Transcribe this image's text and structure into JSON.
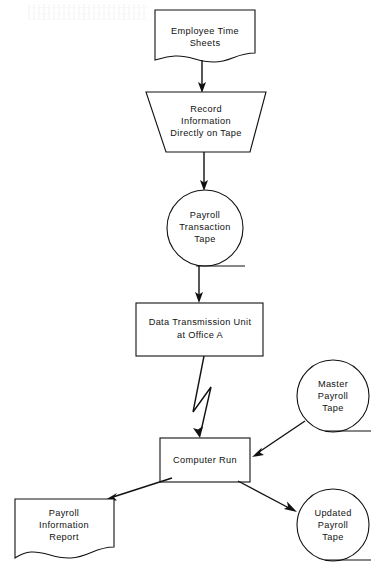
{
  "diagram": {
    "background_color": "#ffffff",
    "line_color": "#111111",
    "nodes": [
      {
        "id": "employee-time-sheets",
        "shape": "document",
        "label_lines": [
          "Employee  Time",
          "Sheets"
        ],
        "x": 205,
        "y": 33
      },
      {
        "id": "record-information",
        "shape": "manual-operation-trapezoid",
        "label_lines": [
          "Record",
          "Information",
          "Directly  on  Tape"
        ],
        "x": 206,
        "y": 122
      },
      {
        "id": "payroll-transaction-tape",
        "shape": "magnetic-tape-circle",
        "label_lines": [
          "Payroll",
          "Transaction",
          "Tape"
        ],
        "x": 205,
        "y": 228
      },
      {
        "id": "data-transmission-unit",
        "shape": "process-rectangle",
        "label_lines": [
          "Data  Transmission  Unit",
          "at  Office  A"
        ],
        "x": 200,
        "y": 329
      },
      {
        "id": "master-payroll-tape",
        "shape": "magnetic-tape-circle",
        "label_lines": [
          "Master",
          "Payroll",
          "Tape"
        ],
        "x": 333,
        "y": 396
      },
      {
        "id": "computer-run",
        "shape": "process-rectangle",
        "label_lines": [
          "Computer  Run"
        ],
        "x": 205,
        "y": 460
      },
      {
        "id": "payroll-information-report",
        "shape": "document",
        "label_lines": [
          "Payroll",
          "Information",
          "Report"
        ],
        "x": 64,
        "y": 524
      },
      {
        "id": "updated-payroll-tape",
        "shape": "magnetic-tape-circle",
        "label_lines": [
          "Updated",
          "Payroll",
          "Tape"
        ],
        "x": 333,
        "y": 525
      }
    ],
    "connectors": [
      {
        "id": "sheets-to-record",
        "from": "employee-time-sheets",
        "to": "record-information",
        "style": "straight-arrow"
      },
      {
        "id": "record-to-transaction-tape",
        "from": "record-information",
        "to": "payroll-transaction-tape",
        "style": "straight-arrow"
      },
      {
        "id": "transaction-tape-to-transmission",
        "from": "payroll-transaction-tape",
        "to": "data-transmission-unit",
        "style": "straight-arrow"
      },
      {
        "id": "transmission-to-computer-run",
        "from": "data-transmission-unit",
        "to": "computer-run",
        "style": "lightning-zigzag-arrow"
      },
      {
        "id": "master-tape-to-computer-run",
        "from": "master-payroll-tape",
        "to": "computer-run",
        "style": "diagonal-arrow"
      },
      {
        "id": "computer-run-to-report",
        "from": "computer-run",
        "to": "payroll-information-report",
        "style": "diagonal-arrow"
      },
      {
        "id": "computer-run-to-updated-tape",
        "from": "computer-run",
        "to": "updated-payroll-tape",
        "style": "diagonal-arrow"
      }
    ]
  }
}
